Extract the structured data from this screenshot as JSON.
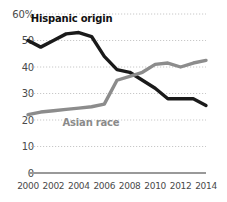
{
  "chart_data": {
    "type": "line",
    "title": "",
    "xlabel": "",
    "ylabel": "",
    "ylim": [
      0,
      60
    ],
    "xlim": [
      2000,
      2014
    ],
    "grid": true,
    "grid_style": "dotted horizontal gridlines",
    "legend": "inline series labels on plot",
    "x": [
      2000,
      2001,
      2002,
      2003,
      2004,
      2005,
      2006,
      2007,
      2008,
      2009,
      2010,
      2011,
      2012,
      2013,
      2014
    ],
    "y_ticks": [
      "0",
      "10",
      "20",
      "30",
      "40",
      "50",
      "60%"
    ],
    "y_tick_values": [
      0,
      10,
      20,
      30,
      40,
      50,
      60
    ],
    "x_ticks": [
      "2000",
      "2002",
      "2004",
      "2006",
      "2008",
      "2010",
      "2012",
      "2014"
    ],
    "x_tick_values": [
      2000,
      2002,
      2004,
      2006,
      2008,
      2010,
      2012,
      2014
    ],
    "series": [
      {
        "name": "Hispanic origin",
        "color": "#1a1a1a",
        "values": [
          50,
          47.5,
          50,
          52.5,
          53,
          51.5,
          44,
          39,
          38,
          35,
          32,
          28,
          28,
          28,
          25.5
        ],
        "label_x": 2004,
        "label_y": 58
      },
      {
        "name": "Asian race",
        "color": "#8c8c8c",
        "values": [
          22,
          23,
          23.5,
          24,
          24.5,
          25,
          26,
          35,
          36.5,
          38,
          41,
          41.5,
          40,
          41.5,
          42.5
        ],
        "label_x": 2005,
        "label_y": 19
      }
    ]
  },
  "axis": {
    "percent_suffix": "%",
    "baseline_color": "#999999",
    "gridline_color": "#c8c8c8",
    "tick_text_color": "#4a4a4a"
  }
}
